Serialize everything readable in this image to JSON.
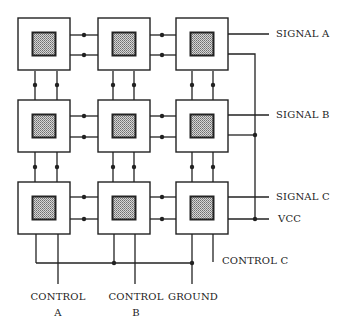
{
  "diagram": {
    "grid": {
      "rows": 3,
      "cols": 3
    },
    "cell": {
      "outer_size": 52,
      "inner_size": 23
    },
    "col_x": [
      18,
      98,
      176
    ],
    "row_y": [
      18,
      100,
      182
    ],
    "colors": {
      "line": "#222222",
      "inner_fill": "#bdbdbd",
      "inner_dot": "#7a7a7a",
      "background": "#ffffff"
    }
  },
  "labels": {
    "signal_a": "SIGNAL A",
    "signal_b": "SIGNAL B",
    "signal_c": "SIGNAL C",
    "vcc": "VCC",
    "control_c": "CONTROL C",
    "control_a_line1": "CONTROL",
    "control_a_line2": "A",
    "control_b_line1": "CONTROL",
    "control_b_line2": "B",
    "ground": "GROUND"
  }
}
